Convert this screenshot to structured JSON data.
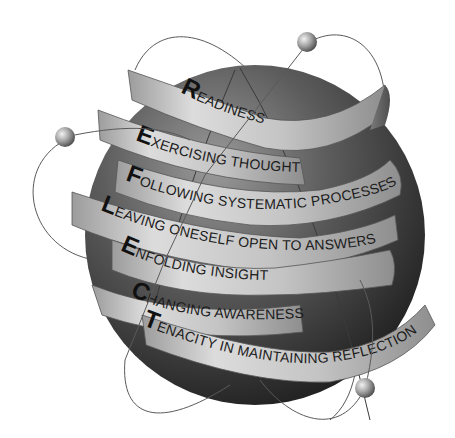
{
  "diagram": {
    "colors": {
      "sphere_light": "#8a8a8a",
      "sphere_dark": "#2a2a2a",
      "ribbon_light": "#d9d9d9",
      "ribbon_mid": "#a8a8a8",
      "ribbon_shadow": "#6e6e6e",
      "orbit_line": "#555555",
      "text": "#1c1c1c"
    },
    "ribbons": [
      {
        "initial": "R",
        "rest": "EADINESS"
      },
      {
        "initial": "E",
        "rest": "XERCISING THOUGHT"
      },
      {
        "initial": "F",
        "rest": "OLLOWING SYSTEMATIC PROCESSES"
      },
      {
        "initial": "L",
        "rest": "EAVING ONESELF OPEN TO ANSWERS"
      },
      {
        "initial": "E",
        "rest": "NFOLDING INSIGHTS"
      },
      {
        "initial": "C",
        "rest": "HANGING AWARENESS"
      },
      {
        "initial": "T",
        "rest": "ENACITY IN MAINTAINING REFLECTION"
      }
    ],
    "orbit_balls": [
      "top-right",
      "left",
      "bottom-right"
    ]
  }
}
